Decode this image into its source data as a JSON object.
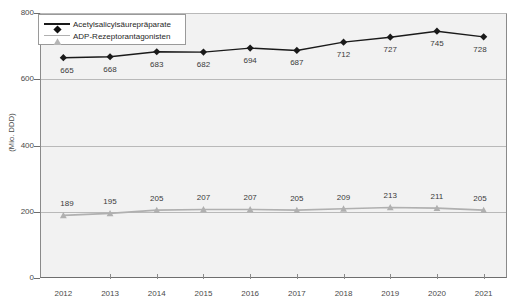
{
  "chart_data": {
    "type": "line",
    "title": "",
    "xlabel": "",
    "ylabel": "(Mio. DDD)",
    "categories": [
      "2012",
      "2013",
      "2014",
      "2015",
      "2016",
      "2017",
      "2018",
      "2019",
      "2020",
      "2021"
    ],
    "ylim": [
      0,
      800
    ],
    "yticks": [
      "0",
      "200",
      "400",
      "600",
      "800"
    ],
    "ytick_values": [
      0,
      200,
      400,
      600,
      800
    ],
    "grid": "horizontal",
    "legend_position": "top-left",
    "series": [
      {
        "name": "Acetylsalicylsäurepräparate",
        "color": "#1a1a1a",
        "marker": "diamond",
        "values": [
          665,
          668,
          683,
          682,
          694,
          687,
          712,
          727,
          745,
          728
        ]
      },
      {
        "name": "ADP-Rezeptorantagonisten",
        "color": "#b0b0b0",
        "marker": "triangle",
        "values": [
          189,
          195,
          205,
          207,
          207,
          205,
          209,
          213,
          211,
          205
        ]
      }
    ]
  },
  "colors": {
    "plot_background": "#f2f2f2",
    "gridline": "#b9b9b9",
    "axis": "#6e6e6e",
    "series_primary": "#1a1a1a",
    "series_secondary": "#b0b0b0",
    "text": "#3a3a3a"
  }
}
